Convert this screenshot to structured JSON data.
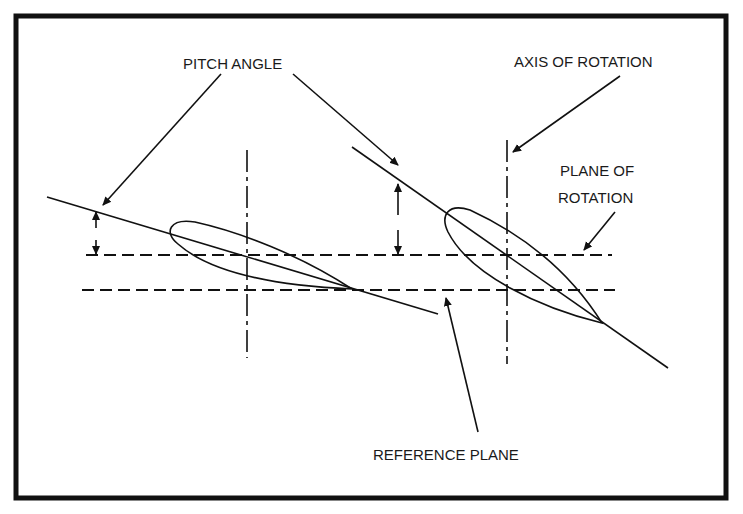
{
  "figure": {
    "type": "diagram",
    "colors": {
      "line": "#111111",
      "background": "#ffffff",
      "text": "#1a1a1a"
    }
  },
  "labels": {
    "pitch_angle": "PITCH ANGLE",
    "axis_of_rotation": "AXIS OF ROTATION",
    "plane_of_rotation_line1": "PLANE OF",
    "plane_of_rotation_line2": "ROTATION",
    "reference_plane": "REFERENCE PLANE"
  },
  "elements": {
    "blade_sections": [
      {
        "name": "low-pitch-airfoil",
        "leading_edge": [
          170,
          235
        ],
        "trailing_edge": [
          352,
          289
        ]
      },
      {
        "name": "high-pitch-airfoil",
        "leading_edge": [
          444,
          215
        ],
        "trailing_edge": [
          602,
          323
        ]
      }
    ],
    "chord_lines": [
      {
        "from": [
          47,
          197
        ],
        "to": [
          438,
          314
        ]
      },
      {
        "from": [
          352,
          147
        ],
        "to": [
          668,
          368
        ]
      }
    ],
    "planes": {
      "plane_of_rotation_y": 255,
      "reference_plane_y": 290
    },
    "axes_x": [
      247,
      507
    ]
  }
}
